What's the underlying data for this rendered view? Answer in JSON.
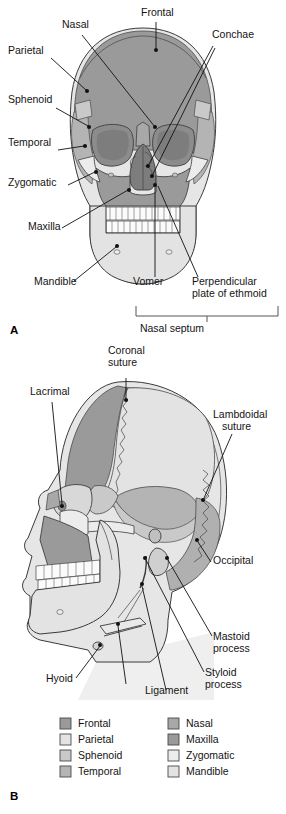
{
  "figure": {
    "panels": [
      {
        "id": "A",
        "letter": "A",
        "view": "anterior view of skull",
        "labels": [
          {
            "text": "Nasal",
            "x": 62,
            "y": 28
          },
          {
            "text": "Frontal",
            "x": 141,
            "y": 16
          },
          {
            "text": "Conchae",
            "x": 212,
            "y": 38
          },
          {
            "text": "Parietal",
            "x": 8,
            "y": 54
          },
          {
            "text": "Sphenoid",
            "x": 8,
            "y": 103
          },
          {
            "text": "Temporal",
            "x": 8,
            "y": 146
          },
          {
            "text": "Zygomatic",
            "x": 8,
            "y": 186
          },
          {
            "text": "Maxilla",
            "x": 28,
            "y": 230
          },
          {
            "text": "Mandible",
            "x": 34,
            "y": 285
          },
          {
            "text": "Vomer",
            "x": 133,
            "y": 285
          }
        ],
        "wrapped_labels": [
          {
            "line1": "Perpendicular",
            "line2": "plate of ethmoid",
            "x": 192,
            "y": 285
          }
        ],
        "bracket_label": "Nasal septum"
      },
      {
        "id": "B",
        "letter": "B",
        "view": "lateral view of skull",
        "labels": [
          {
            "text": "Lacrimal",
            "x": 30,
            "y": 395
          },
          {
            "text": "Occipital",
            "x": 213,
            "y": 564
          },
          {
            "text": "Hyoid",
            "x": 46,
            "y": 682
          },
          {
            "text": "Ligament",
            "x": 145,
            "y": 694
          }
        ],
        "wrapped_labels": [
          {
            "line1": "Coronal",
            "line2": "suture",
            "x": 108,
            "y": 354
          },
          {
            "line1": "Lambdoidal",
            "line2": "suture",
            "x": 213,
            "y": 418
          },
          {
            "line1": "Mastoid",
            "line2": "process",
            "x": 213,
            "y": 640
          },
          {
            "line1": "Styloid",
            "line2": "process",
            "x": 205,
            "y": 676
          }
        ]
      }
    ],
    "legend": {
      "columns": [
        {
          "items": [
            {
              "label": "Frontal",
              "color": "#9a9a9a"
            },
            {
              "label": "Parietal",
              "color": "#e3e3e3"
            },
            {
              "label": "Sphenoid",
              "color": "#c9c9c9"
            },
            {
              "label": "Temporal",
              "color": "#b4b4b4"
            }
          ]
        },
        {
          "items": [
            {
              "label": "Nasal",
              "color": "#a8a8a8"
            },
            {
              "label": "Maxilla",
              "color": "#9a9a9a"
            },
            {
              "label": "Zygomatic",
              "color": "#ececec"
            },
            {
              "label": "Mandible",
              "color": "#e3e3e3"
            }
          ]
        }
      ]
    },
    "colors": {
      "frontal": "#9a9a9a",
      "parietal": "#e3e3e3",
      "sphenoid": "#c9c9c9",
      "temporal": "#b4b4b4",
      "nasal": "#a8a8a8",
      "maxilla": "#9a9a9a",
      "zygomatic": "#ececec",
      "mandible": "#e3e3e3",
      "occipital": "#b0b0b0",
      "orbit": "#8c8c8c",
      "orbit_deep": "#7d7d7d",
      "tooth": "#fbfbfb",
      "background": "#ffffff",
      "stroke": "#3a3a3a",
      "leader": "#111111"
    }
  }
}
